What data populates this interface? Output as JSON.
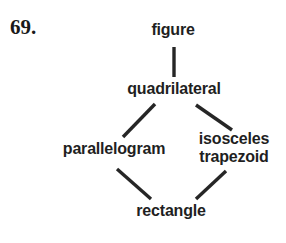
{
  "problem": {
    "number_label": "69."
  },
  "diagram": {
    "type": "concept-hierarchy",
    "background_color": "#ffffff",
    "text_color": "#1f1f1f",
    "edge_color": "#262626",
    "nodes": [
      {
        "id": "figure",
        "label": "figure",
        "level": 0
      },
      {
        "id": "quadrilateral",
        "label": "quadrilateral",
        "level": 1
      },
      {
        "id": "parallelogram",
        "label": "parallelogram",
        "level": 2
      },
      {
        "id": "isosceles-trapezoid",
        "label_line1": "isosceles",
        "label_line2": "trapezoid",
        "level": 2
      },
      {
        "id": "rectangle",
        "label": "rectangle",
        "level": 3
      }
    ],
    "edges": [
      {
        "from": "figure",
        "to": "quadrilateral",
        "style": "vertical"
      },
      {
        "from": "quadrilateral",
        "to": "parallelogram",
        "style": "diagonal-left"
      },
      {
        "from": "quadrilateral",
        "to": "isosceles-trapezoid",
        "style": "diagonal-right"
      },
      {
        "from": "parallelogram",
        "to": "rectangle",
        "style": "diagonal-right"
      },
      {
        "from": "isosceles-trapezoid",
        "to": "rectangle",
        "style": "diagonal-left"
      }
    ]
  }
}
